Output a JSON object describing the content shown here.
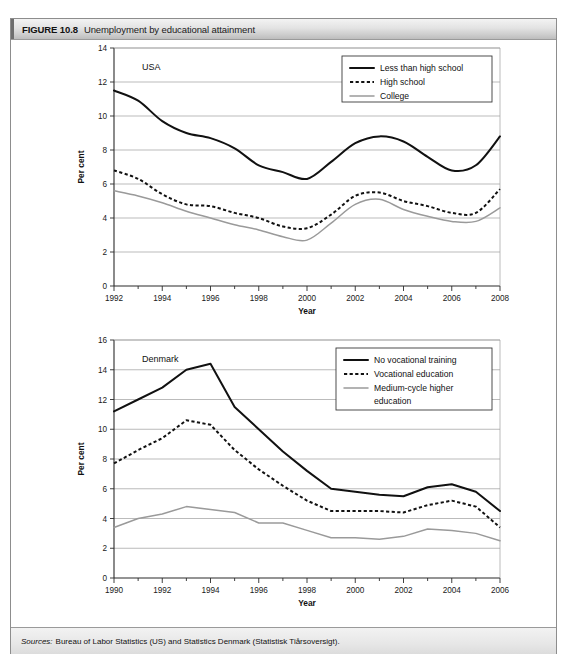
{
  "figure": {
    "number": "FIGURE 10.8",
    "title": "Unemployment by educational attainment",
    "sources_label": "Sources:",
    "sources_text": "Bureau of Labor Statistics (US) and Statistics Denmark (Statistisk Tiårsoversigt)."
  },
  "colors": {
    "series_dark": "#111111",
    "series_gray": "#9a9a9a",
    "grid": "#9d9d9d",
    "axis": "#2b2b2b",
    "header_bg": "#e3e3e3"
  },
  "chart_data": [
    {
      "type": "line",
      "title": "USA",
      "xlabel": "Year",
      "ylabel": "Per cent",
      "xlim": [
        1992,
        2008
      ],
      "ylim": [
        0,
        14
      ],
      "ytick_step": 2,
      "yticks": [
        "0",
        "2",
        "4",
        "6",
        "8",
        "10",
        "12",
        "14"
      ],
      "xticks": [
        "1992",
        "1994",
        "1996",
        "1998",
        "2000",
        "2002",
        "2004",
        "2006",
        "2008"
      ],
      "xtick_minor_step": 1,
      "grid": true,
      "legend_position": "top-right",
      "x": [
        1992,
        1993,
        1994,
        1995,
        1996,
        1997,
        1998,
        1999,
        2000,
        2001,
        2002,
        2003,
        2004,
        2005,
        2006,
        2007,
        2008
      ],
      "series": [
        {
          "name": "Less than high school",
          "style": "solid",
          "color": "#111111",
          "values": [
            11.5,
            10.9,
            9.7,
            9.0,
            8.7,
            8.1,
            7.1,
            6.7,
            6.3,
            7.3,
            8.4,
            8.8,
            8.5,
            7.6,
            6.8,
            7.1,
            8.8
          ]
        },
        {
          "name": "High school",
          "style": "dotted",
          "color": "#111111",
          "values": [
            6.8,
            6.3,
            5.4,
            4.8,
            4.7,
            4.3,
            4.0,
            3.5,
            3.4,
            4.2,
            5.3,
            5.5,
            5.0,
            4.7,
            4.3,
            4.3,
            5.7
          ]
        },
        {
          "name": "College",
          "style": "solid-gray",
          "color": "#9a9a9a",
          "values": [
            5.6,
            5.3,
            4.9,
            4.4,
            4.0,
            3.6,
            3.3,
            2.9,
            2.7,
            3.7,
            4.8,
            5.1,
            4.5,
            4.1,
            3.8,
            3.8,
            4.6
          ]
        }
      ]
    },
    {
      "type": "line",
      "title": "Denmark",
      "xlabel": "Year",
      "ylabel": "Per cent",
      "xlim": [
        1990,
        2006
      ],
      "ylim": [
        0,
        16
      ],
      "ytick_step": 2,
      "yticks": [
        "0",
        "2",
        "4",
        "6",
        "8",
        "10",
        "12",
        "14",
        "16"
      ],
      "xticks": [
        "1990",
        "1992",
        "1994",
        "1996",
        "1998",
        "2000",
        "2002",
        "2004",
        "2006"
      ],
      "xtick_minor_step": 1,
      "grid": true,
      "legend_position": "top-right",
      "x": [
        1990,
        1991,
        1992,
        1993,
        1994,
        1995,
        1996,
        1997,
        1998,
        1999,
        2000,
        2001,
        2002,
        2003,
        2004,
        2005,
        2006
      ],
      "series": [
        {
          "name": "No vocational training",
          "style": "solid",
          "color": "#111111",
          "values": [
            11.2,
            12.0,
            12.8,
            14.0,
            14.4,
            11.5,
            10.0,
            8.5,
            7.2,
            6.0,
            5.8,
            5.6,
            5.5,
            6.1,
            6.3,
            5.8,
            4.5
          ]
        },
        {
          "name": "Vocational education",
          "style": "dotted",
          "color": "#111111",
          "values": [
            7.7,
            8.6,
            9.4,
            10.6,
            10.3,
            8.6,
            7.3,
            6.2,
            5.2,
            4.5,
            4.5,
            4.5,
            4.4,
            4.9,
            5.2,
            4.8,
            3.4
          ]
        },
        {
          "name": "Medium-cycle higher education",
          "style": "solid-gray",
          "color": "#9a9a9a",
          "values": [
            3.4,
            4.0,
            4.3,
            4.8,
            4.6,
            4.4,
            3.7,
            3.7,
            3.2,
            2.7,
            2.7,
            2.6,
            2.8,
            3.3,
            3.2,
            3.0,
            2.5
          ]
        }
      ]
    }
  ]
}
